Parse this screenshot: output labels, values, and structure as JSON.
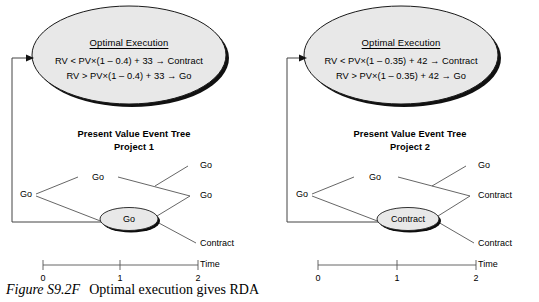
{
  "figure": {
    "caption_label": "Figure S9.2F",
    "caption_text": "Optimal execution gives RDA",
    "background_color": "#ffffff",
    "ellipse_fill": "#e8e8e8",
    "line_color": "#000000"
  },
  "panels": [
    {
      "id": "project-1",
      "bubble": {
        "title": "Optimal Execution",
        "line1": "RV < PV×(1 – 0.4) + 33 → Contract",
        "line2": "RV > PV×(1 – 0.4) + 33 → Go"
      },
      "tree_title_line1": "Present Value Event Tree",
      "tree_title_line2": "Project 1",
      "root_node": "Go",
      "upper_node": "Go",
      "left_label": "Go",
      "leaves": [
        "Go",
        "Go",
        "Contract"
      ],
      "axis": {
        "ticks": [
          "0",
          "1",
          "2"
        ],
        "label": "Time"
      }
    },
    {
      "id": "project-2",
      "bubble": {
        "title": "Optimal Execution",
        "line1": "RV < PV×(1 – 0.35) + 42 → Contract",
        "line2": "RV > PV×(1 – 0.35) + 42 → Go"
      },
      "tree_title_line1": "Present Value Event Tree",
      "tree_title_line2": "Project 2",
      "root_node": "Contract",
      "upper_node": "Go",
      "left_label": "Go",
      "leaves": [
        "Go",
        "Contract",
        "Contract"
      ],
      "axis": {
        "ticks": [
          "0",
          "1",
          "2"
        ],
        "label": "Time"
      }
    }
  ]
}
